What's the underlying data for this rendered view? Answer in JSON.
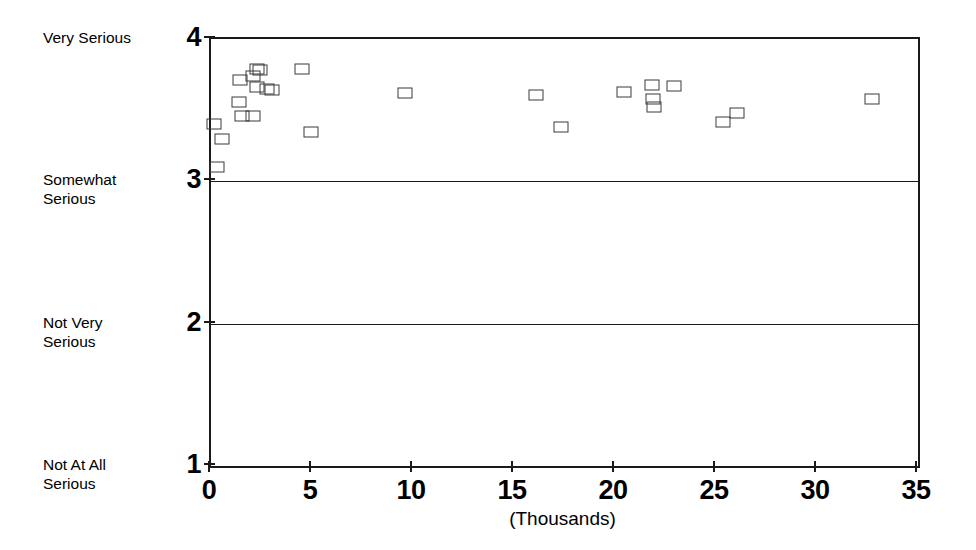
{
  "chart_data": {
    "type": "scatter",
    "title": "",
    "subtitle": "",
    "xlabel": "(Thousands)",
    "ylabel": "",
    "xlim": [
      0,
      35
    ],
    "ylim": [
      1,
      4
    ],
    "grid": true,
    "legend_position": "none",
    "x_ticks": [
      {
        "value": 0,
        "label": "0"
      },
      {
        "value": 5,
        "label": "5"
      },
      {
        "value": 10,
        "label": "10"
      },
      {
        "value": 15,
        "label": "15"
      },
      {
        "value": 20,
        "label": "20"
      },
      {
        "value": 25,
        "label": "25"
      },
      {
        "value": 30,
        "label": "30"
      },
      {
        "value": 35,
        "label": "35"
      }
    ],
    "y_ticks": [
      {
        "value": 4,
        "label": "4",
        "category": "Very Serious"
      },
      {
        "value": 3,
        "label": "3",
        "category": "Somewhat Serious"
      },
      {
        "value": 2,
        "label": "2",
        "category": "Not Very Serious"
      },
      {
        "value": 1,
        "label": "1",
        "category": "Not At All Serious"
      }
    ],
    "y_category_labels": [
      {
        "value": 4,
        "lines": [
          "Very Serious"
        ]
      },
      {
        "value": 3,
        "lines": [
          "Somewhat",
          "Serious"
        ]
      },
      {
        "value": 2,
        "lines": [
          "Not Very",
          "Serious"
        ]
      },
      {
        "value": 1,
        "lines": [
          "Not At All",
          "Serious"
        ]
      }
    ],
    "gridlines_y": [
      3,
      2
    ],
    "marker_style": "open-square",
    "points": [
      {
        "x": 0.15,
        "y": 3.4
      },
      {
        "x": 0.55,
        "y": 3.3
      },
      {
        "x": 0.3,
        "y": 3.1
      },
      {
        "x": 1.45,
        "y": 3.71
      },
      {
        "x": 1.4,
        "y": 3.56
      },
      {
        "x": 1.55,
        "y": 3.46
      },
      {
        "x": 2.1,
        "y": 3.74
      },
      {
        "x": 2.3,
        "y": 3.79
      },
      {
        "x": 2.45,
        "y": 3.78
      },
      {
        "x": 2.3,
        "y": 3.66
      },
      {
        "x": 2.75,
        "y": 3.65
      },
      {
        "x": 2.1,
        "y": 3.46
      },
      {
        "x": 3.0,
        "y": 3.64
      },
      {
        "x": 4.5,
        "y": 3.79
      },
      {
        "x": 4.95,
        "y": 3.35
      },
      {
        "x": 9.6,
        "y": 3.62
      },
      {
        "x": 16.1,
        "y": 3.61
      },
      {
        "x": 17.35,
        "y": 3.38
      },
      {
        "x": 20.45,
        "y": 3.63
      },
      {
        "x": 21.85,
        "y": 3.68
      },
      {
        "x": 21.9,
        "y": 3.58
      },
      {
        "x": 21.95,
        "y": 3.52
      },
      {
        "x": 22.9,
        "y": 3.67
      },
      {
        "x": 25.35,
        "y": 3.42
      },
      {
        "x": 26.05,
        "y": 3.48
      },
      {
        "x": 32.7,
        "y": 3.58
      }
    ]
  }
}
